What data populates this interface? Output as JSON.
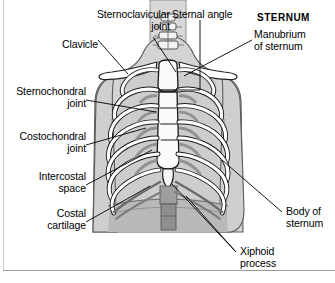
{
  "figure": {
    "heading": "STERNUM",
    "background_color": "#ffffff",
    "line_color": "#000000",
    "body_fill": "#d2d2d2",
    "body_fill_dark": "#b4b4b4",
    "bone_fill": "#ffffff",
    "cartilage_fill": "#a8a8a8"
  },
  "labels": [
    {
      "id": "sternoclavicular-joint",
      "text": "Sternoclavicular\njoint"
    },
    {
      "id": "sternal-angle",
      "text": "Sternal angle"
    },
    {
      "id": "sternum-heading",
      "text": "STERNUM"
    },
    {
      "id": "manubrium-of-sternum",
      "text": "Manubrium\nof sternum"
    },
    {
      "id": "clavicle",
      "text": "Clavicle"
    },
    {
      "id": "sternochondral-joint",
      "text": "Sternochondral\njoint"
    },
    {
      "id": "costochondral-joint",
      "text": "Costochondral\njoint"
    },
    {
      "id": "intercostal-space",
      "text": "Intercostal\nspace"
    },
    {
      "id": "costal-cartilage",
      "text": "Costal\ncartilage"
    },
    {
      "id": "xiphoid-process",
      "text": "Xiphoid\nprocess"
    },
    {
      "id": "body-of-sternum",
      "text": "Body of\nsternum"
    }
  ]
}
